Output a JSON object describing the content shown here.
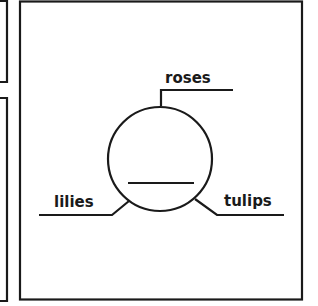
{
  "diagram": {
    "type": "labeled-circle",
    "labels": {
      "top": "roses",
      "left": "lilies",
      "right": "tulips"
    },
    "colors": {
      "stroke": "#1a1a1a",
      "background": "#ffffff"
    }
  }
}
